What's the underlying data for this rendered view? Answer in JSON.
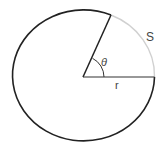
{
  "diagram": {
    "labels": {
      "arc": "S",
      "angle": "θ",
      "radius": "r"
    },
    "colors": {
      "circle": "#222222",
      "arc_highlight": "#cfcfcf",
      "text": "#444444"
    }
  }
}
